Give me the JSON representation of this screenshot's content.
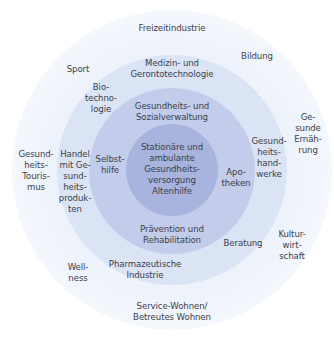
{
  "diagram": {
    "colors": {
      "core": "#a8b4de",
      "ring_inner": "#c3cdeb",
      "ring_middle": "#dbe4f5",
      "ring_outer": "#eef3fb",
      "text": "#3a3f4a"
    },
    "core": {
      "label": "Stationäre und\nambulante\nGesundheits-\nversorgung\nAltenhilfe"
    },
    "inner_ring": [
      {
        "label": "Gesundheits- und\nSozialverwaltung"
      },
      {
        "label": "Selbst-\nhilfe"
      },
      {
        "label": "Apo-\ntheken"
      },
      {
        "label": "Prävention und\nRehabilitation"
      }
    ],
    "middle_ring": [
      {
        "label": "Medizin- und\nGerontotechnologie"
      },
      {
        "label": "Bio-\ntechno-\nlogie"
      },
      {
        "label": "Handel\nmit Ge-\nsund-\nheits-\nproduk-\nten"
      },
      {
        "label": "Gesund-\nheits-\nhand-\nwerke"
      },
      {
        "label": "Beratung"
      },
      {
        "label": "Pharmazeutische\nIndustrie"
      }
    ],
    "outer_ring": [
      {
        "label": "Freizeitindustrie"
      },
      {
        "label": "Bildung"
      },
      {
        "label": "Sport"
      },
      {
        "label": "Ge-\nsunde\nErnäh-\nrung"
      },
      {
        "label": "Gesund-\nheits-\nTouris-\nmus"
      },
      {
        "label": "Kultur-\nwirt-\nschaft"
      },
      {
        "label": "Well-\nness"
      },
      {
        "label": "Service-Wohnen/\nBetreutes Wohnen"
      }
    ]
  }
}
